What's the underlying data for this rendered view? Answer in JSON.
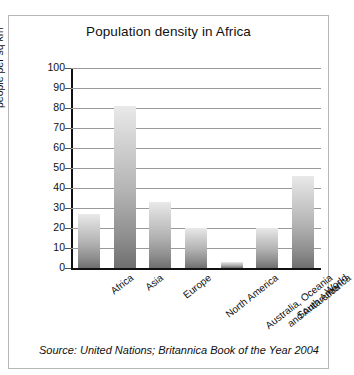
{
  "chart_data": {
    "type": "bar",
    "title": "Population density in Africa",
    "xlabel": "",
    "ylabel": "people per sq km",
    "ylim": [
      0,
      100
    ],
    "ytick_step": 10,
    "yticks": [
      100,
      90,
      80,
      70,
      60,
      50,
      40,
      30,
      20,
      10,
      0
    ],
    "grid": true,
    "legend": false,
    "categories": [
      "Africa",
      "Asia",
      "Europe",
      "North America",
      "Australia, Oceania and Antarctica",
      "South America",
      "World"
    ],
    "category_lines": [
      [
        "Africa"
      ],
      [
        "Asia"
      ],
      [
        "Europe"
      ],
      [
        "North America"
      ],
      [
        "Australia, Oceania",
        "and Antarctica"
      ],
      [
        "South America"
      ],
      [
        "World"
      ]
    ],
    "values": [
      27,
      81,
      33,
      20,
      3,
      20,
      46
    ],
    "bar_fill_top": "#e9e9e9",
    "bar_fill_bottom": "#6f6f6f",
    "axis_color": "#111111",
    "grid_color": "#9a9a9a"
  },
  "caption": "Source: United Nations; Britannica Book of the Year 2004"
}
